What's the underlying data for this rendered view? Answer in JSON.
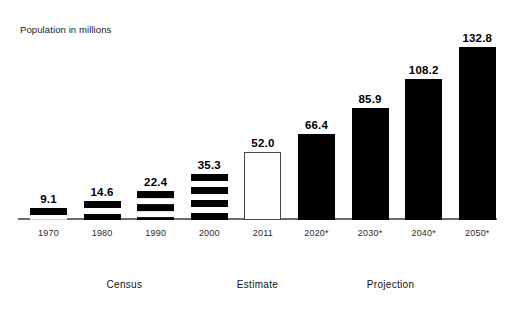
{
  "chart_data": {
    "type": "bar",
    "title": "Population in millions",
    "xlabel": "",
    "ylabel": "Population in millions",
    "ylim": [
      0,
      140
    ],
    "grid": false,
    "legend_position": "bottom",
    "categories": [
      "1970",
      "1980",
      "1990",
      "2000",
      "2011",
      "2020*",
      "2030*",
      "2040*",
      "2050*"
    ],
    "values": [
      9.1,
      14.6,
      22.4,
      35.3,
      52.0,
      66.4,
      85.9,
      108.2,
      132.8
    ],
    "value_labels": [
      "9.1",
      "14.6",
      "22.4",
      "35.3",
      "52.0",
      "66.4",
      "85.9",
      "108.2",
      "132.8"
    ],
    "series": [
      {
        "name": "Population",
        "values": [
          9.1,
          14.6,
          22.4,
          35.3,
          52.0,
          66.4,
          85.9,
          108.2,
          132.8
        ]
      }
    ],
    "bar_styles": [
      "striped",
      "striped",
      "striped",
      "striped",
      "hollow",
      "solid",
      "solid",
      "solid",
      "solid"
    ],
    "categories_meta": [
      {
        "label": "1970",
        "value": 9.1,
        "value_label": "9.1",
        "style": "striped",
        "group": "Census"
      },
      {
        "label": "1980",
        "value": 14.6,
        "value_label": "14.6",
        "style": "striped",
        "group": "Census"
      },
      {
        "label": "1990",
        "value": 22.4,
        "value_label": "22.4",
        "style": "striped",
        "group": "Census"
      },
      {
        "label": "2000",
        "value": 35.3,
        "value_label": "35.3",
        "style": "striped",
        "group": "Census"
      },
      {
        "label": "2011",
        "value": 52.0,
        "value_label": "52.0",
        "style": "hollow",
        "group": "Estimate"
      },
      {
        "label": "2020*",
        "value": 66.4,
        "value_label": "66.4",
        "style": "solid",
        "group": "Projection"
      },
      {
        "label": "2030*",
        "value": 85.9,
        "value_label": "85.9",
        "style": "solid",
        "group": "Projection"
      },
      {
        "label": "2040*",
        "value": 108.2,
        "value_label": "108.2",
        "style": "solid",
        "group": "Projection"
      },
      {
        "label": "2050*",
        "value": 132.8,
        "value_label": "132.8",
        "style": "solid",
        "group": "Projection"
      }
    ],
    "legend": [
      {
        "label": "Census",
        "style": "striped",
        "span": 4
      },
      {
        "label": "Estimate",
        "style": "hollow",
        "span": 1
      },
      {
        "label": "Projection",
        "style": "solid",
        "span": 4
      }
    ],
    "footnote_marker": "*",
    "colors": {
      "bar_solid": "#000000",
      "bar_hollow_fill": "#ffffff",
      "bar_outline": "#4a4a4a",
      "stripe_light": "#ffffff",
      "stripe_dark": "#000000",
      "axis": "#6e6e6e",
      "text": "#111111",
      "legend_text_on_dark": "#ffffff"
    }
  }
}
